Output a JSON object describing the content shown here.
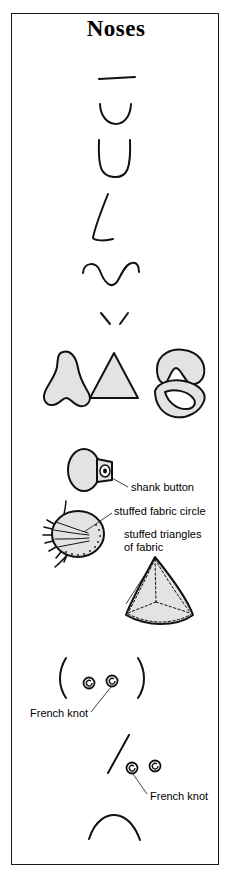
{
  "page": {
    "title": "Noses",
    "border_color": "#1a1a1a",
    "background": "#ffffff",
    "ink_color": "#111111",
    "fill_gray": "#e3e3e3"
  },
  "labels": {
    "shank_button": "shank button",
    "stuffed_fabric_circle": "stuffed fabric circle",
    "stuffed_triangles_line1": "stuffed triangles",
    "stuffed_triangles_line2": "of fabric",
    "french_knot_1": "French knot",
    "french_knot_2": "French knot"
  },
  "figures": [
    {
      "name": "straight-line-nose",
      "style": "line",
      "row": 1
    },
    {
      "name": "u-curve-nose",
      "style": "shallow-u-curve",
      "row": 2
    },
    {
      "name": "deep-u-nose",
      "style": "deep-u-outline",
      "row": 3
    },
    {
      "name": "hook-nose",
      "style": "hooked-line",
      "row": 4
    },
    {
      "name": "wavy-nose",
      "style": "double-wave",
      "row": 5
    },
    {
      "name": "v-ticks-nose",
      "style": "two-short-strokes",
      "row": 6
    },
    {
      "name": "filled-nose-blob",
      "style": "filled-nostril-shape",
      "row": 7
    },
    {
      "name": "filled-triangle-nose",
      "style": "filled-triangle",
      "row": 7
    },
    {
      "name": "filled-crescent-upper",
      "style": "filled-crescent-notched",
      "row": 7
    },
    {
      "name": "filled-crescent-lower",
      "style": "filled-crescent",
      "row": 7
    },
    {
      "name": "shank-button-nose",
      "style": "oval-button-with-shank",
      "row": 8
    },
    {
      "name": "stuffed-fabric-circle-nose",
      "style": "gathered-stuffed-circle",
      "row": 9
    },
    {
      "name": "stuffed-triangle-nose",
      "style": "stuffed-seamed-triangle",
      "row": 10
    },
    {
      "name": "parenthesis-french-knot-nose",
      "style": "two-brackets-two-knots",
      "row": 11
    },
    {
      "name": "slash-french-knot-nose",
      "style": "slash-with-two-knots",
      "row": 12
    },
    {
      "name": "arc-nose",
      "style": "bridge-arc",
      "row": 13
    }
  ]
}
